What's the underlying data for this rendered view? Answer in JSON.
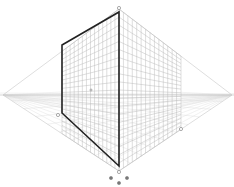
{
  "diagram": {
    "type": "two-point-perspective-grid",
    "width": 234,
    "height": 187,
    "horizon_y": 95,
    "vanishing_points": {
      "left": {
        "x": 3,
        "y": 95
      },
      "right": {
        "x": 232,
        "y": 95
      }
    },
    "center_axis": {
      "x": 119,
      "top": 9,
      "bottom": 171
    },
    "left_plane": {
      "x_near": 119,
      "x_far": 62,
      "columns": 14,
      "rows": 20
    },
    "right_plane": {
      "x_near": 119,
      "x_far": 181,
      "columns": 14,
      "rows": 20
    },
    "ground_plane": {
      "rows": 10
    },
    "selection_rect": {
      "points": [
        [
          62,
          45
        ],
        [
          119,
          12
        ],
        [
          119,
          166
        ],
        [
          62,
          113
        ]
      ],
      "stroke": "#222222"
    },
    "handles": {
      "top": {
        "x": 119,
        "y": 8
      },
      "right_bottom": {
        "x": 181,
        "y": 129
      },
      "left_bottom": {
        "x": 58,
        "y": 115
      },
      "center_point": {
        "x": 91,
        "y": 90
      },
      "bottom_center": {
        "x": 119,
        "y": 172
      },
      "bottom_left": {
        "x": 111,
        "y": 178
      },
      "bottom_right": {
        "x": 127,
        "y": 178
      },
      "bottom_lower": {
        "x": 119,
        "y": 183
      }
    },
    "colors": {
      "grid": "#bdbdbd",
      "grid_light": "#dcdcdc",
      "outline": "#222222",
      "handle": "#888888",
      "background": "#ffffff"
    }
  }
}
